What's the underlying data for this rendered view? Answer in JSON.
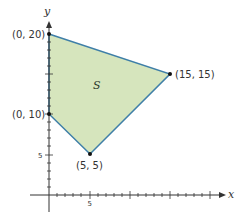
{
  "diagram": {
    "region_label": "S",
    "region_fill": "#d6e5bd",
    "region_stroke": "#3f7fa8",
    "x_axis_label": "x",
    "y_axis_label": "y",
    "x_tick_label": "5",
    "y_tick_label": "5",
    "vertices": [
      {
        "label": "(0, 20)",
        "x": 0,
        "y": 20
      },
      {
        "label": "(15, 15)",
        "x": 15,
        "y": 15
      },
      {
        "label": "(5, 5)",
        "x": 5,
        "y": 5
      },
      {
        "label": "(0, 10)",
        "x": 0,
        "y": 10
      }
    ]
  }
}
